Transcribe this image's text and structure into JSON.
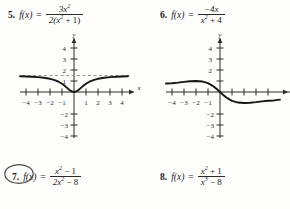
{
  "page": {
    "background_color": "#fdfdfb",
    "ink_color": "#1b1b1b",
    "annotation_color": "#4a4a4a"
  },
  "problems": [
    {
      "number": "5.",
      "function_label": "f(x)",
      "equals": "=",
      "numerator": "3x",
      "numerator_exponent": "2",
      "denominator_prefix": "2(x",
      "denominator_exponent": "2",
      "denominator_suffix": " + 1)",
      "plain": "f(x) = 3x^2 / (2(x^2 + 1))",
      "circled": false
    },
    {
      "number": "6.",
      "function_label": "f(x)",
      "equals": "=",
      "numerator": "−4x",
      "numerator_exponent": "",
      "denominator_prefix": "x",
      "denominator_exponent": "2",
      "denominator_suffix": " + 4",
      "plain": "f(x) = -4x / (x^2 + 4)",
      "circled": false
    },
    {
      "number": "7.",
      "function_label": "f(x)",
      "equals": "=",
      "numerator": "x",
      "numerator_exponent": "2",
      "numerator_suffix": " − 1",
      "denominator_prefix": "2x",
      "denominator_exponent": "2",
      "denominator_suffix": " − 8",
      "plain": "f(x) = (x^2 - 1) / (2x^2 - 8)",
      "circled": true
    },
    {
      "number": "8.",
      "function_label": "f(x)",
      "equals": "=",
      "numerator": "x",
      "numerator_exponent": "2",
      "numerator_suffix": " + 1",
      "denominator_prefix": "x",
      "denominator_exponent": "3",
      "denominator_suffix": " − 8",
      "plain": "f(x) = (x^2 + 1) / (x^3 - 8)",
      "circled": false
    }
  ],
  "chart_data": [
    {
      "id": "graph-5",
      "type": "line",
      "title": "",
      "xlabel": "x",
      "ylabel": "y",
      "xlim": [
        -5,
        5
      ],
      "ylim": [
        -4.6,
        4.6
      ],
      "xticks": [
        -4,
        -3,
        -2,
        -1,
        1,
        2,
        3,
        4
      ],
      "xtick_labels": [
        "−4",
        "−3",
        "−2",
        "−1",
        "1",
        "2",
        "3",
        "4"
      ],
      "yticks": [
        4,
        3,
        2,
        1,
        -2,
        -3,
        -4
      ],
      "ytick_labels": [
        "4",
        "3",
        "2",
        "1",
        "−2",
        "−3",
        "−4"
      ],
      "grid": false,
      "legend": "none",
      "series": [
        {
          "name": "3x^2 / (2(x^2+1))",
          "x": [
            -5.0,
            -4.5,
            -4.0,
            -3.5,
            -3.0,
            -2.5,
            -2.0,
            -1.75,
            -1.5,
            -1.25,
            -1.0,
            -0.8,
            -0.6,
            -0.4,
            -0.2,
            0.0,
            0.2,
            0.4,
            0.6,
            0.8,
            1.0,
            1.25,
            1.5,
            1.75,
            2.0,
            2.5,
            3.0,
            3.5,
            4.0,
            4.5,
            5.0
          ],
          "y": [
            1.442,
            1.427,
            1.412,
            1.389,
            1.35,
            1.293,
            1.2,
            1.131,
            1.038,
            0.915,
            0.75,
            0.585,
            0.397,
            0.207,
            0.0577,
            0.0,
            0.0577,
            0.207,
            0.397,
            0.585,
            0.75,
            0.915,
            1.038,
            1.131,
            1.2,
            1.293,
            1.35,
            1.389,
            1.412,
            1.427,
            1.442
          ]
        }
      ],
      "asymptotes": [
        {
          "type": "horizontal",
          "value": 1.5,
          "style": "dashed"
        }
      ]
    },
    {
      "id": "graph-6",
      "type": "line",
      "title": "",
      "xlabel": "x",
      "ylabel": "y",
      "xlim": [
        -5,
        5
      ],
      "ylim": [
        -4.6,
        4.6
      ],
      "xticks": [
        -4,
        -3,
        -2,
        -1,
        1,
        2,
        3,
        4
      ],
      "xtick_labels": [
        "−4",
        "−3",
        "−2",
        "−1",
        "1",
        "2",
        "3",
        "4"
      ],
      "yticks": [
        4,
        3,
        2,
        1,
        -2,
        -3,
        -4
      ],
      "ytick_labels": [
        "4",
        "3",
        "2",
        "1",
        "−2",
        "−3",
        "−4"
      ],
      "grid": false,
      "legend": "none",
      "series": [
        {
          "name": "-4x / (x^2+4)",
          "x": [
            -5.0,
            -4.5,
            -4.0,
            -3.5,
            -3.0,
            -2.5,
            -2.0,
            -1.5,
            -1.0,
            -0.75,
            -0.5,
            -0.25,
            0.0,
            0.25,
            0.5,
            0.75,
            1.0,
            1.5,
            2.0,
            2.5,
            3.0,
            3.5,
            4.0,
            4.5,
            5.0
          ],
          "y": [
            0.69,
            0.766,
            0.8,
            0.848,
            0.923,
            0.976,
            1.0,
            0.96,
            0.8,
            0.649,
            0.471,
            0.246,
            0.0,
            -0.246,
            -0.471,
            -0.649,
            -0.8,
            -0.96,
            -1.0,
            -0.976,
            -0.923,
            -0.848,
            -0.8,
            -0.766,
            -0.69
          ]
        }
      ],
      "asymptotes": []
    }
  ]
}
